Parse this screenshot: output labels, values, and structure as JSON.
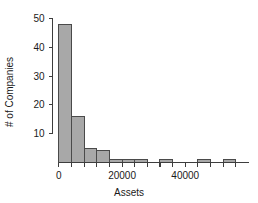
{
  "chart_data": {
    "type": "bar",
    "title": "",
    "xlabel": "Assets",
    "ylabel": "# of Companies",
    "xlim": [
      -2000,
      60000
    ],
    "ylim": [
      0,
      50
    ],
    "grid": false,
    "legend": null,
    "bin_width": 4000,
    "xticks": [
      0,
      20000,
      40000
    ],
    "xtick_labels": [
      "0",
      "20000",
      "40000"
    ],
    "xtick_minor": [
      0,
      4000,
      8000,
      12000,
      16000,
      20000,
      24000,
      28000,
      32000,
      36000,
      40000,
      44000,
      48000,
      52000,
      56000
    ],
    "yticks": [
      10,
      20,
      30,
      40,
      50
    ],
    "ytick_labels": [
      "10",
      "20",
      "30",
      "40",
      "50"
    ],
    "bar_fill": "#a8a8a8",
    "bar_stroke": "#4a4a4a",
    "categories": [
      "0-4000",
      "4000-8000",
      "8000-12000",
      "12000-16000",
      "16000-20000",
      "20000-24000",
      "24000-28000",
      "28000-32000",
      "32000-36000",
      "36000-40000",
      "40000-44000",
      "44000-48000",
      "48000-52000",
      "52000-56000"
    ],
    "bin_starts": [
      0,
      4000,
      8000,
      12000,
      16000,
      20000,
      24000,
      28000,
      32000,
      36000,
      40000,
      44000,
      48000,
      52000
    ],
    "values": [
      48,
      16,
      5,
      4,
      1,
      1,
      1,
      0,
      1,
      0,
      0,
      1,
      0,
      1
    ]
  },
  "axis": {
    "y_label": "# of Companies",
    "x_label": "Assets"
  }
}
